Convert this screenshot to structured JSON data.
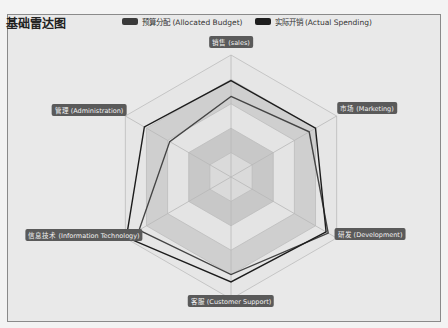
{
  "title": "基础雷达图",
  "legend": [
    {
      "label": "预算分配 (Allocated Budget)",
      "color": "#333333"
    },
    {
      "label": "实际开销 (Actual Spending)",
      "color": "#222222"
    }
  ],
  "indicators": [
    {
      "name": "销售 (sales)",
      "x": 231,
      "y": 42
    },
    {
      "name": "市场 (Marketing)",
      "x": 367,
      "y": 108
    },
    {
      "name": "研发 (Development)",
      "x": 370,
      "y": 234
    },
    {
      "name": "客服 (Customer Support)",
      "x": 231,
      "y": 301
    },
    {
      "name": "信息技术 (Information Technology)",
      "x": 84,
      "y": 235
    },
    {
      "name": "管理 (Administration)",
      "x": 89,
      "y": 110
    }
  ],
  "chart_data": {
    "type": "radar",
    "title": "基础雷达图",
    "indicators": [
      "销售 (sales)",
      "市场 (Marketing)",
      "研发 (Development)",
      "客服 (Customer Support)",
      "信息技术 (Information Technology)",
      "管理 (Administration)"
    ],
    "series": [
      {
        "name": "预算分配 (Allocated Budget)",
        "values_normalized": [
          0.66,
          0.74,
          0.92,
          0.8,
          0.87,
          0.58
        ]
      },
      {
        "name": "实际开销 (Actual Spending)",
        "values_normalized": [
          0.79,
          0.8,
          0.9,
          0.86,
          0.99,
          0.82
        ]
      }
    ],
    "split_number": 5,
    "legend_position": "top"
  }
}
